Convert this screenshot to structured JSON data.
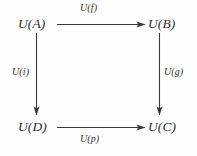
{
  "diagram": {
    "type": "commutative-square",
    "background_color": "#fefefe",
    "stroke_color": "#3a3a3a",
    "text_color": "#2e2e2e",
    "nodes": [
      {
        "id": "A",
        "label": "U(A)",
        "position": "top-left"
      },
      {
        "id": "B",
        "label": "U(B)",
        "position": "top-right"
      },
      {
        "id": "D",
        "label": "U(D)",
        "position": "bottom-left"
      },
      {
        "id": "C",
        "label": "U(C)",
        "position": "bottom-right"
      }
    ],
    "edges": [
      {
        "id": "top",
        "label": "U(f)",
        "from": "A",
        "to": "B",
        "direction": "right"
      },
      {
        "id": "right",
        "label": "U(g)",
        "from": "B",
        "to": "C",
        "direction": "down"
      },
      {
        "id": "left",
        "label": "U(i)",
        "from": "A",
        "to": "D",
        "direction": "down"
      },
      {
        "id": "bottom",
        "label": "U(p)",
        "from": "D",
        "to": "C",
        "direction": "right"
      }
    ]
  }
}
